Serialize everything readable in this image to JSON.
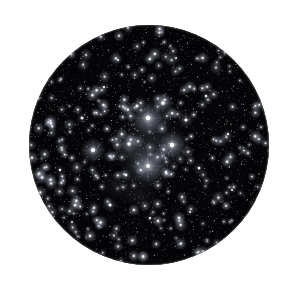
{
  "image": {
    "kind": "astrophotograph",
    "subject": "open star cluster with reflection nebulosity",
    "presentation": "circular eyepiece field of view",
    "alt_text": "Circular telescopic field of view showing a dense star field with a bright central open star cluster surrounded by faint nebulosity",
    "width": 283,
    "height": 291
  },
  "canvas": {
    "background_color": "#ffffff",
    "sky_color": "#050507"
  },
  "field_of_view": {
    "shape": "circle",
    "center_x": 149,
    "center_y": 145,
    "radius": 120,
    "rim_vignette": true
  },
  "starfield": {
    "description": "dense scatter of faint background stars filling the entire disk",
    "faint_star_count": 2200,
    "mid_star_count": 260,
    "star_color": "#ffffff",
    "seed": 20240517,
    "twinkle_sizes_px": [
      0.5,
      0.8,
      1.1,
      1.5,
      2.0
    ]
  },
  "nebulosity": {
    "description": "soft blue-white reflection nebulosity wrapping the bright cluster members",
    "color": "#c9d4e8",
    "patches": [
      {
        "x": 148,
        "y": 166,
        "rx": 26,
        "ry": 24,
        "opacity": 0.3
      },
      {
        "x": 150,
        "y": 120,
        "rx": 22,
        "ry": 19,
        "opacity": 0.26
      },
      {
        "x": 172,
        "y": 146,
        "rx": 19,
        "ry": 17,
        "opacity": 0.22
      },
      {
        "x": 129,
        "y": 146,
        "rx": 17,
        "ry": 15,
        "opacity": 0.17
      },
      {
        "x": 148,
        "y": 143,
        "rx": 40,
        "ry": 36,
        "opacity": 0.12
      },
      {
        "x": 120,
        "y": 186,
        "rx": 22,
        "ry": 16,
        "opacity": 0.1
      },
      {
        "x": 93,
        "y": 151,
        "rx": 14,
        "ry": 12,
        "opacity": 0.13
      },
      {
        "x": 163,
        "y": 104,
        "rx": 13,
        "ry": 11,
        "opacity": 0.12
      },
      {
        "x": 140,
        "y": 196,
        "rx": 18,
        "ry": 14,
        "opacity": 0.09
      }
    ]
  },
  "bright_stars": [
    {
      "name": "star-alpha",
      "x": 148,
      "y": 118,
      "radius": 2.8,
      "glow": 15,
      "brightness": 1.0
    },
    {
      "name": "star-beta",
      "x": 172,
      "y": 145,
      "radius": 2.6,
      "glow": 13,
      "brightness": 0.95
    },
    {
      "name": "star-gamma",
      "x": 93,
      "y": 150,
      "radius": 2.5,
      "glow": 12,
      "brightness": 0.92
    },
    {
      "name": "star-delta",
      "x": 148,
      "y": 166,
      "radius": 2.2,
      "glow": 17,
      "brightness": 0.8
    },
    {
      "name": "star-epsilon",
      "x": 163,
      "y": 103,
      "radius": 2.1,
      "glow": 10,
      "brightness": 0.82
    },
    {
      "name": "star-zeta",
      "x": 129,
      "y": 144,
      "radius": 2.0,
      "glow": 9,
      "brightness": 0.78
    },
    {
      "name": "star-eta",
      "x": 186,
      "y": 120,
      "radius": 1.8,
      "glow": 8,
      "brightness": 0.7
    },
    {
      "name": "star-theta",
      "x": 137,
      "y": 106,
      "radius": 1.7,
      "glow": 7,
      "brightness": 0.66
    },
    {
      "name": "star-iota",
      "x": 110,
      "y": 205,
      "radius": 1.8,
      "glow": 7,
      "brightness": 0.68
    },
    {
      "name": "star-kappa",
      "x": 82,
      "y": 118,
      "radius": 1.6,
      "glow": 6,
      "brightness": 0.62
    },
    {
      "name": "star-lambda",
      "x": 199,
      "y": 168,
      "radius": 1.5,
      "glow": 6,
      "brightness": 0.58
    },
    {
      "name": "star-mu",
      "x": 126,
      "y": 175,
      "radius": 1.5,
      "glow": 6,
      "brightness": 0.58
    },
    {
      "name": "star-nu",
      "x": 166,
      "y": 172,
      "radius": 1.5,
      "glow": 6,
      "brightness": 0.6
    },
    {
      "name": "star-xi",
      "x": 206,
      "y": 96,
      "radius": 1.4,
      "glow": 5,
      "brightness": 0.54
    },
    {
      "name": "star-omicron",
      "x": 60,
      "y": 170,
      "radius": 1.4,
      "glow": 5,
      "brightness": 0.52
    },
    {
      "name": "star-pi",
      "x": 228,
      "y": 134,
      "radius": 1.3,
      "glow": 5,
      "brightness": 0.5
    },
    {
      "name": "star-rho",
      "x": 104,
      "y": 87,
      "radius": 1.3,
      "glow": 5,
      "brightness": 0.5
    },
    {
      "name": "star-sigma",
      "x": 150,
      "y": 218,
      "radius": 1.3,
      "glow": 5,
      "brightness": 0.48
    },
    {
      "name": "star-tau",
      "x": 190,
      "y": 212,
      "radius": 1.2,
      "glow": 4,
      "brightness": 0.46
    },
    {
      "name": "star-upsilon",
      "x": 72,
      "y": 222,
      "radius": 1.2,
      "glow": 4,
      "brightness": 0.44
    },
    {
      "name": "star-phi",
      "x": 232,
      "y": 190,
      "radius": 1.2,
      "glow": 4,
      "brightness": 0.44
    },
    {
      "name": "star-chi",
      "x": 118,
      "y": 60,
      "radius": 1.2,
      "glow": 4,
      "brightness": 0.44
    },
    {
      "name": "star-psi",
      "x": 176,
      "y": 58,
      "radius": 1.2,
      "glow": 4,
      "brightness": 0.42
    },
    {
      "name": "star-omega",
      "x": 52,
      "y": 126,
      "radius": 1.1,
      "glow": 4,
      "brightness": 0.4
    }
  ]
}
